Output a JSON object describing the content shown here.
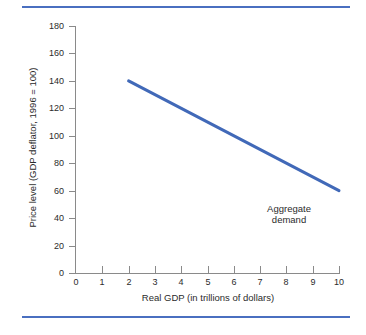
{
  "figure": {
    "background_color": "#ffffff",
    "rule_color": "#4a6fc0",
    "axis_color": "#8a8a8a",
    "text_color": "#2b2b2b"
  },
  "chart_data": {
    "type": "line",
    "title": "",
    "xlabel": "Real GDP (in trillions of dollars)",
    "ylabel": "Price level (GDP deflator, 1996 = 100)",
    "xlim": [
      0,
      10
    ],
    "ylim": [
      0,
      180
    ],
    "xticks": [
      0,
      1,
      2,
      3,
      4,
      5,
      6,
      7,
      8,
      9,
      10
    ],
    "xtick_labels": [
      "0",
      "1",
      "2",
      "3",
      "4",
      "5",
      "6",
      "7",
      "8",
      "9",
      "10"
    ],
    "yticks": [
      0,
      20,
      40,
      60,
      80,
      100,
      120,
      140,
      160,
      180
    ],
    "ytick_labels": [
      "0",
      "20",
      "40",
      "60",
      "80",
      "100",
      "120",
      "140",
      "160",
      "180"
    ],
    "grid": false,
    "legend_position": "none",
    "series": [
      {
        "name": "Aggregate demand",
        "color": "#4169b8",
        "line_width": 3,
        "x": [
          2,
          10
        ],
        "values": [
          140,
          60
        ]
      }
    ],
    "annotations": [
      {
        "text_line_1": "Aggregate",
        "text_line_2": "demand",
        "x": 8.1,
        "y": 47
      }
    ]
  }
}
